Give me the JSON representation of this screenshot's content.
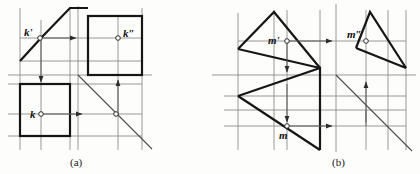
{
  "sheet": {
    "title": "Orthographic projection exercises",
    "width": 420,
    "height": 174,
    "background_color": "#fdfdfc"
  },
  "colors": {
    "thick_outline": "#161616",
    "thin_construction": "#8d8d8d",
    "projection_line": "#5a5a5a",
    "marker_fill": "#ffffff",
    "label_text": "#111111"
  },
  "figures": [
    {
      "id": "figure-a",
      "caption": "(a)",
      "caption_pos": {
        "x": 76,
        "y": 163
      },
      "description": "Three-view projection of a prism with a point K",
      "point_labels": [
        {
          "name": "k-prime",
          "text": "k'",
          "x": 26,
          "y": 36,
          "marker_x": 40,
          "marker_y": 38
        },
        {
          "name": "k-double",
          "text": "k″",
          "x": 124,
          "y": 36,
          "marker_x": 118,
          "marker_y": 38
        },
        {
          "name": "k",
          "text": "k",
          "x": 33,
          "y": 116,
          "marker_x": 41,
          "marker_y": 114
        }
      ],
      "views": [
        {
          "name": "front-view-parallelogram",
          "type": "parallelogram"
        },
        {
          "name": "side-view-square",
          "type": "rectangle"
        },
        {
          "name": "top-view-rectangle",
          "type": "rectangle"
        }
      ],
      "axes": {
        "vertical_x": 78,
        "horizontal_y": 75,
        "miter_line": "45-degree"
      }
    },
    {
      "id": "figure-b",
      "caption": "(b)",
      "caption_pos": {
        "x": 337,
        "y": 163
      },
      "description": "Axonometric house-shaped solid with point M projections",
      "point_labels": [
        {
          "name": "m-prime",
          "text": "m'",
          "x": 64,
          "y": 43,
          "marker_x": 77,
          "marker_y": 41
        },
        {
          "name": "m-double",
          "text": "m″",
          "x": 142,
          "y": 38,
          "marker_x": 156,
          "marker_y": 41
        },
        {
          "name": "m",
          "text": "m",
          "x": 68,
          "y": 136,
          "marker_x": 75,
          "marker_y": 126
        }
      ],
      "views": [
        {
          "name": "front-view-house",
          "type": "gable-profile"
        },
        {
          "name": "side-view-house",
          "type": "gable-profile"
        },
        {
          "name": "top-view-box",
          "type": "parallelogram"
        }
      ],
      "axes": {
        "vertical_x": 126,
        "horizontal_y": 75,
        "miter_line": "45-degree"
      }
    }
  ]
}
